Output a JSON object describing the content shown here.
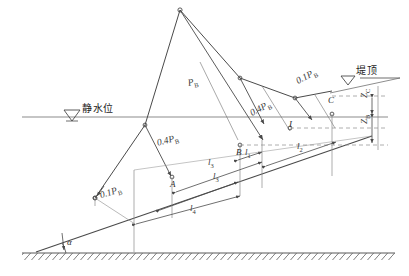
{
  "figure": {
    "type": "engineering-force-diagram"
  },
  "annotations": {
    "still_water_level": "静水位",
    "crest_level": "堤顶",
    "slope_angle": "α"
  },
  "forces": [
    {
      "id": "f_main",
      "label": "P",
      "sub": "B",
      "text": "Pʙ"
    },
    {
      "id": "f_upper",
      "label": "0.4P",
      "sub": "B",
      "text": "0.4Pʙ"
    },
    {
      "id": "f_right",
      "label": "0.1P",
      "sub": "B",
      "text": "0.1Pʙ"
    },
    {
      "id": "f_mid",
      "label": "0.4P",
      "sub": "B",
      "text": "0.4Pʙ"
    },
    {
      "id": "f_lower",
      "label": "0.1P",
      "sub": "B",
      "text": "0.1Pʙ"
    }
  ],
  "force_labels": {
    "p_b": "P",
    "p_b_sub": "B",
    "coef_04": "0.4P",
    "coef_01": "0.1P"
  },
  "points": [
    {
      "id": "pt_a",
      "label": "A"
    },
    {
      "id": "pt_b",
      "label": "B"
    },
    {
      "id": "pt_c",
      "label": "C"
    },
    {
      "id": "pt_i",
      "label": "I"
    }
  ],
  "dimensions": [
    {
      "id": "l1",
      "label": "l",
      "sub": "1"
    },
    {
      "id": "l2",
      "label": "l",
      "sub": "2"
    },
    {
      "id": "l3",
      "label": "l",
      "sub": "3"
    },
    {
      "id": "l4",
      "label": "l",
      "sub": "4"
    }
  ],
  "heights": [
    {
      "id": "zc",
      "label": "Z",
      "sub": "C"
    },
    {
      "id": "zb",
      "label": "Z",
      "sub": "B"
    }
  ],
  "colors": {
    "line": "#4a4a4a",
    "water_line": "#8c8c8c",
    "dashed": "#9a9a9a",
    "ground": "#5a5a5a",
    "text": "#2b2b2b",
    "background": "#ffffff"
  }
}
